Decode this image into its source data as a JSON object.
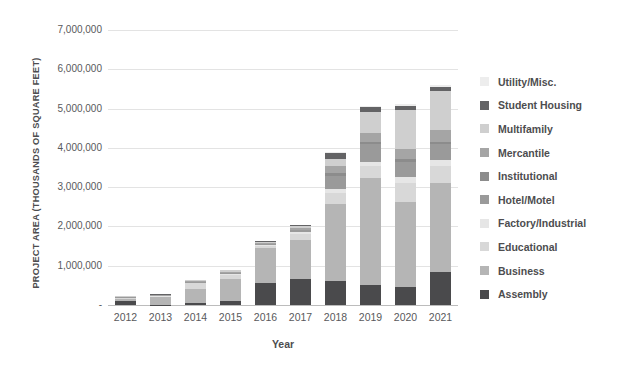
{
  "chart_data": {
    "type": "bar",
    "stacked": true,
    "title": "",
    "xlabel": "Year",
    "ylabel": "PROJECT AREA (THOUSANDS OF SQUARE FEET)",
    "categories": [
      "2012",
      "2013",
      "2014",
      "2015",
      "2016",
      "2017",
      "2018",
      "2019",
      "2020",
      "2021"
    ],
    "ylim": [
      0,
      7000000
    ],
    "yticks": [
      0,
      1000000,
      2000000,
      3000000,
      4000000,
      5000000,
      6000000,
      7000000
    ],
    "ytick_labels": [
      "-",
      "1,000,000",
      "2,000,000",
      "3,000,000",
      "4,000,000",
      "5,000,000",
      "6,000,000",
      "7,000,000"
    ],
    "grid": true,
    "legend_position": "right",
    "series": [
      {
        "name": "Assembly",
        "color": "#4a4a4c",
        "values": [
          95000,
          10000,
          60000,
          95000,
          560000,
          660000,
          620000,
          510000,
          470000,
          840000
        ]
      },
      {
        "name": "Business",
        "color": "#b5b5b5",
        "values": [
          60000,
          185000,
          360000,
          560000,
          900000,
          1000000,
          1950000,
          2730000,
          2150000,
          2260000
        ]
      },
      {
        "name": "Educational",
        "color": "#d8d8d8",
        "values": [
          20000,
          20000,
          130000,
          110000,
          50000,
          150000,
          290000,
          290000,
          490000,
          430000
        ]
      },
      {
        "name": "Factory/Industrial",
        "color": "#e6e6e6",
        "values": [
          10000,
          10000,
          20000,
          30000,
          20000,
          40000,
          100000,
          120000,
          140000,
          160000
        ]
      },
      {
        "name": "Hotel/Motel",
        "color": "#9a9a9a",
        "values": [
          10000,
          10000,
          10000,
          20000,
          20000,
          50000,
          330000,
          440000,
          400000,
          400000
        ]
      },
      {
        "name": "Institutional",
        "color": "#8c8c8c",
        "values": [
          5000,
          5000,
          10000,
          10000,
          10000,
          20000,
          60000,
          60000,
          60000,
          70000
        ]
      },
      {
        "name": "Mercantile",
        "color": "#a5a5a5",
        "values": [
          10000,
          10000,
          15000,
          20000,
          20000,
          40000,
          190000,
          240000,
          260000,
          290000
        ]
      },
      {
        "name": "Multifamily",
        "color": "#cfcfcf",
        "values": [
          15000,
          15000,
          25000,
          40000,
          30000,
          60000,
          190000,
          530000,
          990000,
          1000000
        ]
      },
      {
        "name": "Student Housing",
        "color": "#636365",
        "values": [
          5000,
          5000,
          10000,
          10000,
          10000,
          20000,
          135000,
          130000,
          110000,
          100000
        ]
      },
      {
        "name": "Utility/Misc.",
        "color": "#ededed",
        "values": [
          5000,
          5000,
          10000,
          10000,
          10000,
          10000,
          25000,
          30000,
          40000,
          50000
        ]
      }
    ],
    "totals": [
      235000,
      275000,
      650000,
      905000,
      1630000,
      2050000,
      3890000,
      5080000,
      5110000,
      5600000
    ]
  },
  "legend": {
    "items": [
      {
        "label": "Utility/Misc.",
        "color": "#ededed"
      },
      {
        "label": "Student Housing",
        "color": "#636365"
      },
      {
        "label": "Multifamily",
        "color": "#cfcfcf"
      },
      {
        "label": "Mercantile",
        "color": "#a5a5a5"
      },
      {
        "label": "Institutional",
        "color": "#8c8c8c"
      },
      {
        "label": "Hotel/Motel",
        "color": "#9a9a9a"
      },
      {
        "label": "Factory/Industrial",
        "color": "#e6e6e6"
      },
      {
        "label": "Educational",
        "color": "#d8d8d8"
      },
      {
        "label": "Business",
        "color": "#b5b5b5"
      },
      {
        "label": "Assembly",
        "color": "#4a4a4c"
      }
    ]
  },
  "axes": {
    "y_title": "PROJECT AREA (THOUSANDS OF SQUARE FEET)",
    "x_title": "Year"
  }
}
